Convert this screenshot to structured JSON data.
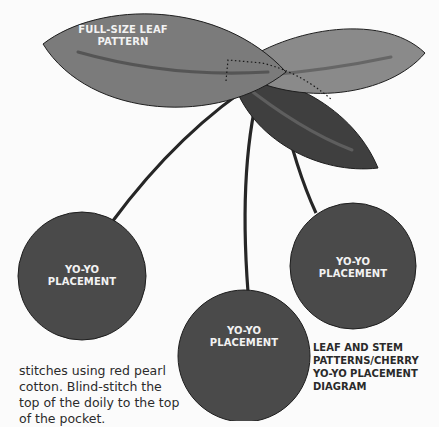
{
  "diagram": {
    "colors": {
      "background": "#fbfbfb",
      "leaf_light": "#7b7b7b",
      "leaf_light_right": "#8a8a8a",
      "leaf_dark": "#3f3f3f",
      "leaf_vein": "#5a5a5a",
      "yoyo_fill": "#4a4a4a",
      "outline": "#1e1e1e",
      "label_text": "#f2f2f2",
      "caption_text": "#2a2a2a"
    },
    "leaf_pattern_label": [
      "FULL-SIZE LEAF",
      "PATTERN"
    ],
    "yoyo_labels": [
      [
        "YO-YO",
        "PLACEMENT"
      ],
      [
        "YO-YO",
        "PLACEMENT"
      ],
      [
        "YO-YO",
        "PLACEMENT"
      ]
    ],
    "caption": [
      "LEAF AND STEM",
      "PATTERNS/CHERRY",
      "YO-YO PLACEMENT",
      "DIAGRAM"
    ],
    "body_text": [
      "stitches using red pearl",
      "cotton. Blind-stitch the",
      "top of the doily to the top",
      "of the pocket."
    ]
  }
}
